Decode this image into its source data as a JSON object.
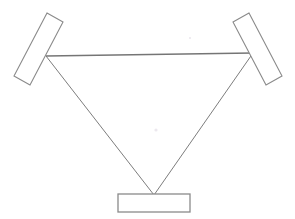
{
  "figure": {
    "background_color": "#ffffff",
    "width": 295,
    "height": 219,
    "line_color": "#8a8a8a",
    "beam_color": "#7d7d7d"
  },
  "components": [
    {
      "id": "left-mirror",
      "label": "Left tilted mirror",
      "shape": "rotated-rectangle",
      "points": "47,13 63,22 30,85 14,76",
      "stroke": "#8a8a8a",
      "fill": "#ffffff"
    },
    {
      "id": "right-mirror",
      "label": "Right tilted mirror",
      "shape": "rotated-rectangle",
      "points": "249,13 233,22 266,85 282,76",
      "stroke": "#8a8a8a",
      "fill": "#ffffff"
    },
    {
      "id": "bottom-element",
      "label": "Bottom flat element",
      "shape": "rectangle",
      "x": 118,
      "y": 194,
      "width": 72,
      "height": 18,
      "stroke": "#8a8a8a",
      "fill": "#ffffff"
    }
  ],
  "beams": [
    {
      "id": "beam-horizontal",
      "label": "Horizontal beam between mirrors",
      "from": "46,56",
      "to": "253,53",
      "stroke": "#757575"
    },
    {
      "id": "beam-left-diagonal",
      "label": "Left diagonal beam to bottom element",
      "from": "46,56",
      "to": "154,195",
      "stroke": "#7d7d7d"
    },
    {
      "id": "beam-right-diagonal",
      "label": "Right diagonal beam to bottom element",
      "from": "253,53",
      "to": "154,195",
      "stroke": "#7d7d7d"
    }
  ],
  "vertices": {
    "left_mirror_hit": "46,56",
    "right_mirror_hit": "253,53",
    "bottom_focus": "154,195"
  },
  "artifacts": [
    {
      "id": "center-speck",
      "label": "Faint scan speck",
      "x": 156,
      "y": 130,
      "r": 1.6,
      "color": "#ece8ee"
    },
    {
      "id": "upper-speck",
      "label": "Faint scan speck upper",
      "x": 190,
      "y": 38,
      "r": 1.1,
      "color": "#f3f1f4"
    }
  ]
}
